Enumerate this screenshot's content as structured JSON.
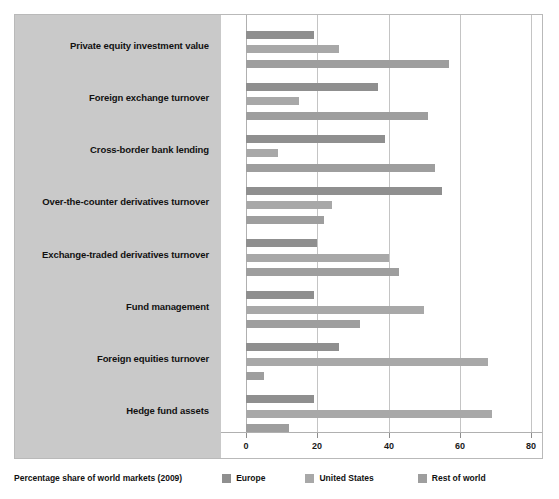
{
  "chart_data": {
    "type": "bar",
    "orientation": "horizontal",
    "title": "",
    "subtitle": "",
    "xlabel": "",
    "ylabel": "",
    "xlim": [
      0,
      80
    ],
    "xticks": [
      0,
      20,
      40,
      60,
      80
    ],
    "grid": true,
    "legend_position": "bottom",
    "legend_caption": "Percentage share of world markets (2009)",
    "categories": [
      "Private equity investment value",
      "Foreign exchange turnover",
      "Cross-border bank lending",
      "Over-the-counter derivatives turnover",
      "Exchange-traded derivatives turnover",
      "Fund management",
      "Foreign equities turnover",
      "Hedge fund assets"
    ],
    "series": [
      {
        "name": "Europe",
        "color": "#8f8f8f",
        "values": [
          19,
          37,
          39,
          55,
          20,
          19,
          26,
          19
        ]
      },
      {
        "name": "United States",
        "color": "#a8a8a8",
        "values": [
          26,
          15,
          9,
          24,
          40,
          50,
          68,
          69
        ]
      },
      {
        "name": "Rest of world",
        "color": "#9e9e9e",
        "values": [
          57,
          51,
          53,
          22,
          43,
          32,
          5,
          12
        ]
      }
    ]
  },
  "axis": {
    "tick_labels": [
      "0",
      "20",
      "40",
      "60",
      "80"
    ]
  },
  "legend": {
    "caption": "Percentage share of world markets (2009)",
    "items": [
      {
        "label": "Europe"
      },
      {
        "label": "United States"
      },
      {
        "label": "Rest of world"
      }
    ]
  }
}
